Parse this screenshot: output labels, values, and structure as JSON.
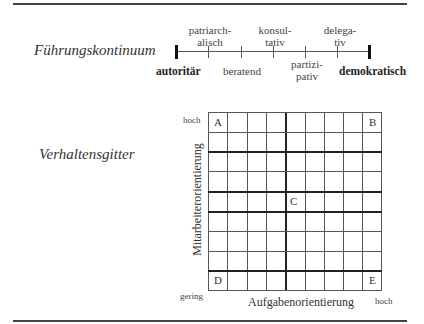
{
  "sections": {
    "continuum_title": "Führungskontinuum",
    "grid_title": "Verhaltensgitter"
  },
  "continuum": {
    "left_pole": "autoritär",
    "right_pole": "demokratisch",
    "styles_above": [
      {
        "line1": "patriarch-",
        "line2": "alisch"
      },
      {
        "line1": "konsul-",
        "line2": "tativ"
      },
      {
        "line1": "delega-",
        "line2": "tiv"
      }
    ],
    "styles_below": [
      {
        "line1": "beratend",
        "line2": ""
      },
      {
        "line1": "partizi-",
        "line2": "pativ"
      }
    ]
  },
  "grid": {
    "rows": 9,
    "cols": 9,
    "corners": {
      "top_left": "A",
      "top_right": "B",
      "center": "C",
      "bottom_left": "D",
      "bottom_right": "E"
    },
    "y_axis_label": "Mitarbeiterorientierung",
    "x_axis_label": "Aufgabenorientierung",
    "y_high": "hoch",
    "low": "gering",
    "x_high": "hoch"
  }
}
